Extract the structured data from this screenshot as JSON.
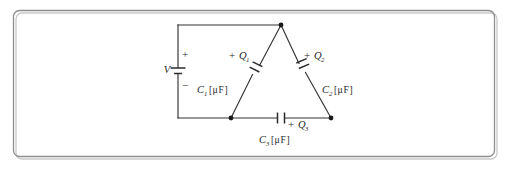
{
  "figure": {
    "kind": "circuit-diagram",
    "background_color": "#ffffff",
    "frame": {
      "stroke_color": "#8d8d8d",
      "shadow_color": "#c9c9c9",
      "corner_radius": 6
    },
    "wire_color": "#333333",
    "label_color": "#1f1f1f"
  },
  "source": {
    "name": "voltage-source",
    "symbol_label": "V",
    "plus_label": "+",
    "minus_label": "−"
  },
  "components": [
    {
      "id": "C1",
      "name": "capacitor-c1",
      "branch": "left-diagonal",
      "charge_sign": "+",
      "charge_symbol": "Q",
      "charge_subscript": "1",
      "cap_symbol": "C",
      "cap_subscript": "1",
      "unit_open": "[",
      "unit_mu": "μ",
      "unit_text": "F",
      "unit_close": "]"
    },
    {
      "id": "C2",
      "name": "capacitor-c2",
      "branch": "right-diagonal",
      "charge_sign": "+",
      "charge_symbol": "Q",
      "charge_subscript": "2",
      "cap_symbol": "C",
      "cap_subscript": "2",
      "unit_open": "[",
      "unit_mu": "μ",
      "unit_text": "F",
      "unit_close": "]"
    },
    {
      "id": "C3",
      "name": "capacitor-c3",
      "branch": "bottom",
      "charge_sign": "+",
      "charge_symbol": "Q",
      "charge_subscript": "3",
      "cap_symbol": "C",
      "cap_subscript": "3",
      "unit_open": "[",
      "unit_mu": "μ",
      "unit_text": "F",
      "unit_close": "]"
    }
  ],
  "nodes": [
    {
      "name": "node-apex",
      "x": 281,
      "y": 25
    },
    {
      "name": "node-bottom-left",
      "x": 231,
      "y": 118
    },
    {
      "name": "node-bottom-right",
      "x": 331,
      "y": 118
    }
  ]
}
